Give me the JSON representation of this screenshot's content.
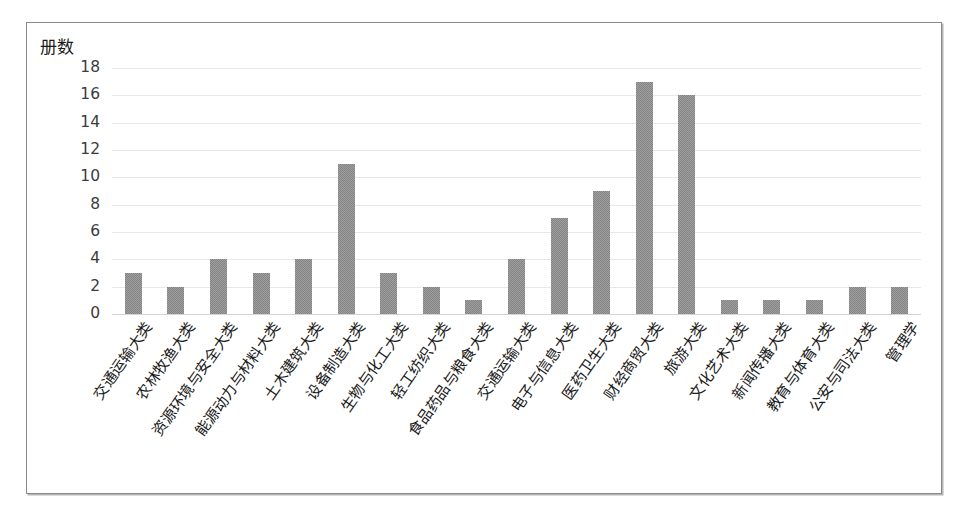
{
  "figure": {
    "axis_title": "册数",
    "frame_border_color": "#8a8a8a",
    "background_color": "#ffffff"
  },
  "chart_data": {
    "type": "bar",
    "title": "",
    "subtitle": "",
    "xlabel": "",
    "ylabel": "册数",
    "ylim": [
      0,
      18
    ],
    "ytick_step": 2,
    "yticks": [
      18,
      16,
      14,
      12,
      10,
      8,
      6,
      4,
      2,
      0
    ],
    "grid": true,
    "grid_axis": "y",
    "legend": false,
    "legend_position": "none",
    "bar_color": "#848484",
    "categories": [
      "交通运输大类",
      "农林牧渔大类",
      "资源环境与安全大类",
      "能源动力与材料大类",
      "土木建筑大类",
      "设备制造大类",
      "生物与化工大类",
      "轻工纺织大类",
      "食品药品与粮食大类",
      "交通运输大类",
      "电子与信息大类",
      "医药卫生大类",
      "财经商贸大类",
      "旅游大类",
      "文化艺术大类",
      "新闻传播大类",
      "教育与体育大类",
      "公安与司法大类",
      "管理学"
    ],
    "values": [
      3,
      2,
      4,
      3,
      4,
      11,
      3,
      2,
      1,
      4,
      7,
      9,
      17,
      16,
      1,
      1,
      1,
      2,
      2
    ]
  }
}
